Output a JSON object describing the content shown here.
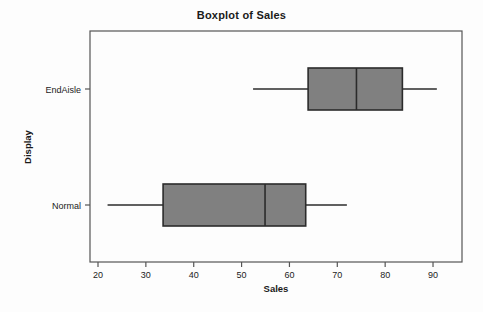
{
  "chart_data": {
    "type": "box",
    "title": "Boxplot of Sales",
    "xlabel": "Sales",
    "ylabel": "Display",
    "orientation": "horizontal",
    "grid": false,
    "legend": "none",
    "xlim": [
      17,
      95
    ],
    "xticks": [
      20,
      30,
      40,
      50,
      60,
      70,
      80,
      90
    ],
    "xtick_labels": [
      "20",
      "30",
      "40",
      "50",
      "60",
      "70",
      "80",
      "90"
    ],
    "categories": [
      "EndAisle",
      "Normal"
    ],
    "boxes": [
      {
        "category": "EndAisle",
        "whisker_low": 52.4,
        "q1": 63.9,
        "median": 74.0,
        "q3": 83.6,
        "whisker_high": 90.8,
        "fill": "#808080",
        "stroke": "#2b2b2b"
      },
      {
        "category": "Normal",
        "whisker_low": 22.0,
        "q1": 33.6,
        "median": 54.9,
        "q3": 63.4,
        "whisker_high": 72.0,
        "fill": "#808080",
        "stroke": "#2b2b2b"
      }
    ],
    "colors": {
      "box_fill": "#808080",
      "box_stroke": "#2b2b2b",
      "frame": "#555555",
      "text": "#1a1a1a",
      "background": "#fdfdfd"
    }
  }
}
